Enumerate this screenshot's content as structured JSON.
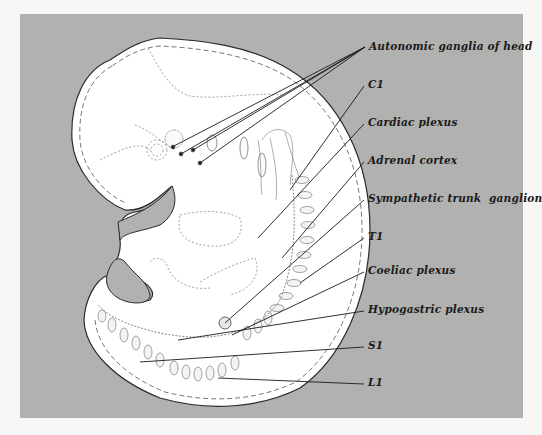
{
  "figure": {
    "type": "anatomical-diagram",
    "background_color": "#b1b1b0",
    "body_color": "#ffffff"
  },
  "labels": [
    {
      "id": "autonomic-ganglia-of-head",
      "text": "Autonomic ganglia of head",
      "x": 369,
      "y": 40
    },
    {
      "id": "c1",
      "text": "C1",
      "x": 368,
      "y": 78
    },
    {
      "id": "cardiac-plexus",
      "text": "Cardiac plexus",
      "x": 368,
      "y": 116
    },
    {
      "id": "adrenal-cortex",
      "text": "Adrenal cortex",
      "x": 368,
      "y": 154
    },
    {
      "id": "sympathetic-trunk-ganglion",
      "text": "Sympathetic trunk  ganglion",
      "x": 368,
      "y": 192
    },
    {
      "id": "t1",
      "text": "T1",
      "x": 368,
      "y": 230
    },
    {
      "id": "coeliac-plexus",
      "text": "Coeliac plexus",
      "x": 368,
      "y": 264
    },
    {
      "id": "hypogastric-plexus",
      "text": "Hypogastric plexus",
      "x": 368,
      "y": 303
    },
    {
      "id": "s1",
      "text": "S1",
      "x": 368,
      "y": 339
    },
    {
      "id": "l1",
      "text": "L1",
      "x": 368,
      "y": 376
    }
  ]
}
